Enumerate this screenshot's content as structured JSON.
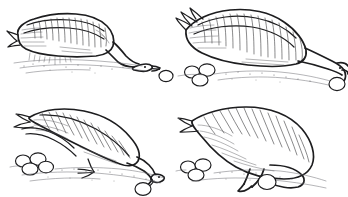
{
  "figure": {
    "medium": "pen-and-ink line drawing",
    "background_color": "#ffffff",
    "ink_color": "#1d1d1f",
    "hatch_color": "#3a3a3c",
    "ground_color": "#6b6b70",
    "egg_fill_color": "#ffffff",
    "panel_layout": "2x2",
    "panel_count": 4,
    "panel_borders": "none",
    "has_text_labels": false
  },
  "panels": [
    {
      "id": "panel-1",
      "index": 1,
      "position": "top-left",
      "name": "sitting-on-nest",
      "description": "Goose crouched low on the nest, body horizontal, neck extended forward and down, bill reaching toward the ground to the right",
      "bird_pose": "crouched, neck extended low to the right",
      "bill_direction": "down-right",
      "eggs": [
        {
          "name": "stray-egg",
          "location": "ground right of bird",
          "count": 1
        }
      ],
      "ground_visible": true
    },
    {
      "id": "panel-2",
      "index": 2,
      "position": "top-right",
      "name": "reaching-beyond-egg",
      "description": "Goose with wings raised over the back, neck stretched far forward and down, bill positioned beyond the stray egg ready to draw it back",
      "bird_pose": "body raised, wings folded high, neck fully extended down-right",
      "bill_direction": "down-right, behind the egg",
      "eggs": [
        {
          "name": "nest-clutch",
          "location": "nest at lower left",
          "count": 3
        },
        {
          "name": "stray-egg",
          "location": "ground at lower right under bill",
          "count": 1
        }
      ],
      "ground_visible": true
    },
    {
      "id": "panel-3",
      "index": 3,
      "position": "bottom-left",
      "name": "rolling-egg-back",
      "description": "Goose leaning forward with neck angled down, underside of the bill contacting the stray egg and rolling it back toward the nest",
      "bird_pose": "standing, body tilted forward, neck angled down-right",
      "bill_direction": "down-right, touching egg",
      "eggs": [
        {
          "name": "nest-clutch",
          "location": "nest at lower left",
          "count": 4
        },
        {
          "name": "rolled-egg",
          "location": "ground at right against bill tip",
          "count": 1
        }
      ],
      "ground_visible": true
    },
    {
      "id": "panel-4",
      "index": 4,
      "position": "bottom-right",
      "name": "tucking-egg-under-breast",
      "description": "Goose seen from behind and above, head turned under the breast, drawing the retrieved egg in beneath the body toward the nest",
      "bird_pose": "body hunched high, head tucked down beneath the breast",
      "bill_direction": "down, under the body",
      "eggs": [
        {
          "name": "nest-clutch",
          "location": "nest at lower left",
          "count": 3
        },
        {
          "name": "retrieved-egg",
          "location": "beneath breast at bill",
          "count": 1
        }
      ],
      "ground_visible": true
    }
  ]
}
